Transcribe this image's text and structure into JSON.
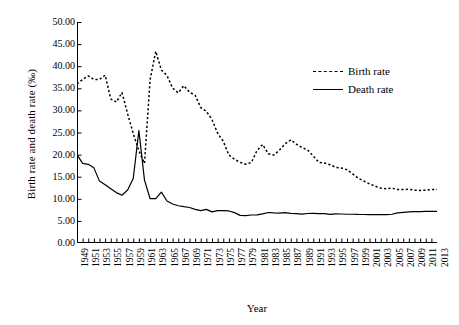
{
  "chart_data": {
    "type": "line",
    "title": "",
    "xlabel": "Year",
    "ylabel": "Birth rate and death rate (‰)",
    "ylim": [
      0,
      50
    ],
    "xlim": [
      1949,
      2013
    ],
    "grid": false,
    "legend_position": "top-right",
    "ytick_labels": [
      "0.00",
      "5.00",
      "10.00",
      "15.00",
      "20.00",
      "25.00",
      "30.00",
      "35.00",
      "40.00",
      "45.00",
      "50.00"
    ],
    "ytick_values": [
      0,
      5,
      10,
      15,
      20,
      25,
      30,
      35,
      40,
      45,
      50
    ],
    "xtick_labels": [
      "1949",
      "1951",
      "1953",
      "1955",
      "1957",
      "1959",
      "1961",
      "1963",
      "1965",
      "1967",
      "1969",
      "1971",
      "1973",
      "1975",
      "1977",
      "1979",
      "1981",
      "1983",
      "1985",
      "1987",
      "1989",
      "1991",
      "1993",
      "1995",
      "1997",
      "1999",
      "2001",
      "2003",
      "2005",
      "2007",
      "2009",
      "2011",
      "2013"
    ],
    "x": [
      1949,
      1950,
      1951,
      1952,
      1953,
      1954,
      1955,
      1956,
      1957,
      1958,
      1959,
      1960,
      1961,
      1962,
      1963,
      1964,
      1965,
      1966,
      1967,
      1968,
      1969,
      1970,
      1971,
      1972,
      1973,
      1974,
      1975,
      1976,
      1977,
      1978,
      1979,
      1980,
      1981,
      1982,
      1983,
      1984,
      1985,
      1986,
      1987,
      1988,
      1989,
      1990,
      1991,
      1992,
      1993,
      1994,
      1995,
      1996,
      1997,
      1998,
      1999,
      2000,
      2001,
      2002,
      2003,
      2004,
      2005,
      2006,
      2007,
      2008,
      2009,
      2010,
      2011,
      2012,
      2013
    ],
    "series": [
      {
        "name": "Birth rate",
        "style": "dashed",
        "values": [
          36.0,
          37.0,
          37.8,
          37.0,
          37.0,
          37.97,
          32.6,
          31.9,
          34.03,
          29.22,
          24.78,
          20.86,
          18.02,
          37.01,
          43.37,
          39.14,
          37.88,
          35.05,
          33.96,
          35.59,
          34.11,
          33.43,
          30.65,
          29.77,
          27.93,
          24.82,
          23.01,
          19.91,
          18.93,
          18.25,
          17.82,
          18.21,
          20.91,
          22.28,
          20.19,
          19.9,
          21.04,
          22.43,
          23.33,
          22.37,
          21.58,
          21.06,
          19.68,
          18.24,
          18.09,
          17.7,
          17.12,
          16.98,
          16.57,
          15.64,
          14.64,
          14.03,
          13.38,
          12.86,
          12.41,
          12.29,
          12.4,
          12.09,
          12.1,
          12.14,
          11.95,
          11.9,
          11.93,
          12.1,
          12.08
        ]
      },
      {
        "name": "Death rate",
        "style": "solid",
        "values": [
          20.0,
          18.0,
          17.8,
          17.0,
          14.0,
          13.18,
          12.28,
          11.4,
          10.8,
          11.98,
          14.59,
          25.43,
          14.24,
          10.02,
          10.04,
          11.5,
          9.5,
          8.83,
          8.43,
          8.21,
          8.03,
          7.6,
          7.32,
          7.61,
          7.04,
          7.34,
          7.32,
          7.25,
          6.87,
          6.25,
          6.21,
          6.34,
          6.36,
          6.6,
          6.9,
          6.82,
          6.78,
          6.86,
          6.72,
          6.64,
          6.54,
          6.67,
          6.7,
          6.64,
          6.64,
          6.49,
          6.57,
          6.56,
          6.51,
          6.5,
          6.46,
          6.45,
          6.43,
          6.41,
          6.4,
          6.42,
          6.51,
          6.81,
          6.93,
          7.06,
          7.08,
          7.11,
          7.14,
          7.15,
          7.16
        ]
      }
    ]
  },
  "legend": {
    "items": [
      {
        "label": "Birth rate",
        "style": "dashed"
      },
      {
        "label": "Death rate",
        "style": "solid"
      }
    ]
  },
  "axes": {
    "x_title": "Year",
    "y_title": "Birth rate and death rate (‰)"
  }
}
